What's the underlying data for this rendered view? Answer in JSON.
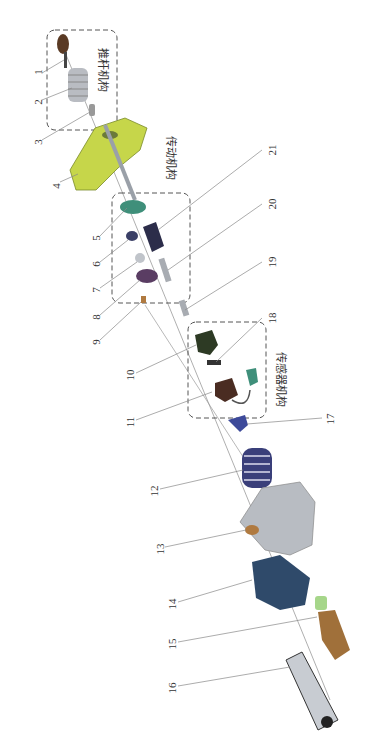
{
  "figure": {
    "type": "exploded-view assembly diagram",
    "orientation": "rotated 90 degrees",
    "groups": [
      {
        "id": "push-rod",
        "label": "推杆机构",
        "parts": [
          1,
          2,
          3
        ]
      },
      {
        "id": "transmission",
        "label": "传动机构",
        "parts": [
          5,
          6,
          7,
          8
        ]
      },
      {
        "id": "sensor",
        "label": "传感器机构",
        "parts": [
          10,
          11,
          18
        ]
      }
    ],
    "callouts": [
      "1",
      "2",
      "3",
      "4",
      "5",
      "6",
      "7",
      "8",
      "9",
      "10",
      "11",
      "12",
      "13",
      "14",
      "15",
      "16",
      "17",
      "18",
      "19",
      "20",
      "21"
    ],
    "colors": {
      "dashed_box": "#555555",
      "leader_line": "#888888",
      "housing_yellow": "#c6d64a",
      "gear_teal": "#3f8f7a",
      "dark_navy": "#2c2d4a",
      "purple_gear": "#5a3d63",
      "spring_navy": "#3a3f7a",
      "gray_housing": "#b8bcc2",
      "motor_blue": "#2f4a6a",
      "brass": "#b07a40",
      "light_green": "#a6d68a",
      "silver_body": "#c8ccd2"
    }
  }
}
